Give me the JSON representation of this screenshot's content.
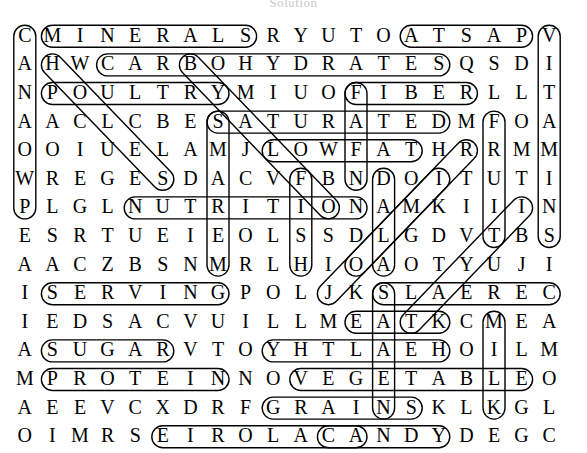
{
  "page": {
    "title": "Solution",
    "type": "word-search-solution"
  },
  "puzzle": {
    "rows": 15,
    "cols": 20,
    "cell_width": 27.6,
    "cell_height": 28.6,
    "origin_x": 11,
    "origin_y": 10,
    "letter_color": "#000000",
    "marker_color": "#000000",
    "background": "#ffffff",
    "grid": [
      [
        "C",
        "M",
        "I",
        "N",
        "E",
        "R",
        "A",
        "L",
        "S",
        "R",
        "Y",
        "U",
        "T",
        "O",
        "A",
        "T",
        "S",
        "A",
        "P",
        "V"
      ],
      [
        "A",
        "H",
        "W",
        "C",
        "A",
        "R",
        "B",
        "O",
        "H",
        "Y",
        "D",
        "R",
        "A",
        "T",
        "E",
        "S",
        "Q",
        "S",
        "D",
        "I"
      ],
      [
        "N",
        "P",
        "O",
        "U",
        "L",
        "T",
        "R",
        "Y",
        "M",
        "I",
        "U",
        "O",
        "F",
        "I",
        "B",
        "E",
        "R",
        "L",
        "L",
        "T"
      ],
      [
        "A",
        "A",
        "C",
        "L",
        "C",
        "B",
        "E",
        "S",
        "A",
        "T",
        "U",
        "R",
        "A",
        "T",
        "E",
        "D",
        "M",
        "F",
        "O",
        "A"
      ],
      [
        "O",
        "O",
        "I",
        "U",
        "E",
        "L",
        "A",
        "M",
        "J",
        "L",
        "O",
        "W",
        "F",
        "A",
        "T",
        "H",
        "R",
        "R",
        "M",
        "M"
      ],
      [
        "W",
        "R",
        "E",
        "G",
        "E",
        "S",
        "D",
        "A",
        "C",
        "V",
        "F",
        "B",
        "N",
        "D",
        "O",
        "I",
        "T",
        "U",
        "T",
        "I"
      ],
      [
        "P",
        "L",
        "G",
        "L",
        "N",
        "U",
        "T",
        "R",
        "I",
        "T",
        "I",
        "O",
        "N",
        "A",
        "M",
        "K",
        "I",
        "I",
        "I",
        "N"
      ],
      [
        "E",
        "S",
        "R",
        "T",
        "U",
        "E",
        "I",
        "E",
        "O",
        "L",
        "S",
        "S",
        "D",
        "L",
        "G",
        "D",
        "V",
        "T",
        "B",
        "S"
      ],
      [
        "A",
        "A",
        "C",
        "Z",
        "B",
        "S",
        "N",
        "M",
        "R",
        "L",
        "H",
        "I",
        "O",
        "A",
        "O",
        "T",
        "Y",
        "U",
        "J",
        "I"
      ],
      [
        "I",
        "S",
        "E",
        "R",
        "V",
        "I",
        "N",
        "G",
        "P",
        "O",
        "L",
        "J",
        "K",
        "S",
        "L",
        "A",
        "E",
        "R",
        "E",
        "C"
      ],
      [
        "I",
        "E",
        "D",
        "S",
        "A",
        "C",
        "V",
        "U",
        "I",
        "L",
        "L",
        "M",
        "E",
        "A",
        "T",
        "K",
        "C",
        "M",
        "E",
        "A"
      ],
      [
        "A",
        "S",
        "U",
        "G",
        "A",
        "R",
        "V",
        "T",
        "O",
        "Y",
        "H",
        "T",
        "L",
        "A",
        "E",
        "H",
        "O",
        "I",
        "L",
        "M"
      ],
      [
        "M",
        "P",
        "R",
        "O",
        "T",
        "E",
        "I",
        "N",
        "N",
        "O",
        "V",
        "E",
        "G",
        "E",
        "T",
        "A",
        "B",
        "L",
        "E",
        "O"
      ],
      [
        "A",
        "E",
        "E",
        "V",
        "C",
        "X",
        "D",
        "R",
        "F",
        "G",
        "R",
        "A",
        "I",
        "N",
        "S",
        "K",
        "L",
        "K",
        "G",
        "L"
      ],
      [
        "O",
        "I",
        "M",
        "R",
        "S",
        "E",
        "I",
        "R",
        "O",
        "L",
        "A",
        "C",
        "A",
        "N",
        "D",
        "Y",
        "D",
        "E",
        "G",
        "C"
      ]
    ],
    "found_words": [
      {
        "word": "MINERALS",
        "row": 0,
        "col": 1,
        "dir": "E",
        "len": 8
      },
      {
        "word": "PASTA",
        "row": 0,
        "col": 18,
        "dir": "W",
        "len": 5
      },
      {
        "word": "CARBOHYDRATES",
        "row": 1,
        "col": 3,
        "dir": "E",
        "len": 13
      },
      {
        "word": "POULTRY",
        "row": 2,
        "col": 1,
        "dir": "E",
        "len": 7
      },
      {
        "word": "FIBER",
        "row": 2,
        "col": 12,
        "dir": "E",
        "len": 5
      },
      {
        "word": "SATURATED",
        "row": 3,
        "col": 7,
        "dir": "E",
        "len": 9
      },
      {
        "word": "LOWFAT",
        "row": 4,
        "col": 9,
        "dir": "E",
        "len": 6
      },
      {
        "word": "NUTRITION",
        "row": 6,
        "col": 4,
        "dir": "E",
        "len": 9
      },
      {
        "word": "SERVING",
        "row": 9,
        "col": 1,
        "dir": "E",
        "len": 7
      },
      {
        "word": "CEREALS",
        "row": 9,
        "col": 19,
        "dir": "W",
        "len": 7
      },
      {
        "word": "MEAT",
        "row": 10,
        "col": 12,
        "dir": "E",
        "len": 4
      },
      {
        "word": "SUGAR",
        "row": 11,
        "col": 1,
        "dir": "E",
        "len": 5
      },
      {
        "word": "HEALTHY",
        "row": 11,
        "col": 15,
        "dir": "W",
        "len": 7
      },
      {
        "word": "PROTEIN",
        "row": 12,
        "col": 1,
        "dir": "E",
        "len": 7
      },
      {
        "word": "VEGETABLE",
        "row": 12,
        "col": 10,
        "dir": "E",
        "len": 9
      },
      {
        "word": "GRAINS",
        "row": 13,
        "col": 9,
        "dir": "E",
        "len": 6
      },
      {
        "word": "CALORIES",
        "row": 14,
        "col": 12,
        "dir": "W",
        "len": 8
      },
      {
        "word": "CANDY",
        "row": 14,
        "col": 11,
        "dir": "E",
        "len": 5
      },
      {
        "word": "CALCIUM",
        "row": 0,
        "col": 0,
        "dir": "S",
        "len": 7
      },
      {
        "word": "FATS",
        "row": 2,
        "col": 12,
        "dir": "S",
        "len": 4
      },
      {
        "word": "SODIUM",
        "row": 3,
        "col": 7,
        "dir": "S",
        "len": 6
      },
      {
        "word": "VITAMINS",
        "row": 0,
        "col": 19,
        "dir": "S",
        "len": 8
      },
      {
        "word": "FOOD",
        "row": 5,
        "col": 10,
        "dir": "S",
        "len": 4
      },
      {
        "word": "DIET",
        "row": 5,
        "col": 13,
        "dir": "S",
        "len": 4
      },
      {
        "word": "MILK",
        "row": 10,
        "col": 17,
        "dir": "S",
        "len": 4
      },
      {
        "word": "FRUIT",
        "row": 3,
        "col": 17,
        "dir": "S",
        "len": 5
      },
      {
        "word": "SEEDS",
        "row": 9,
        "col": 13,
        "dir": "S",
        "len": 5
      },
      {
        "word": "BUTTER",
        "row": 1,
        "col": 6,
        "dir": "SE",
        "len": 6
      },
      {
        "word": "CHEESE",
        "row": 4,
        "col": 16,
        "dir": "SW",
        "len": 6
      },
      {
        "word": "BREAD",
        "row": 6,
        "col": 18,
        "dir": "SW",
        "len": 5
      },
      {
        "word": "SNACK",
        "row": 1,
        "col": 1,
        "dir": "SE",
        "len": 5
      },
      {
        "word": "SALT",
        "row": 8,
        "col": 12,
        "dir": "NE",
        "len": 4
      }
    ]
  }
}
